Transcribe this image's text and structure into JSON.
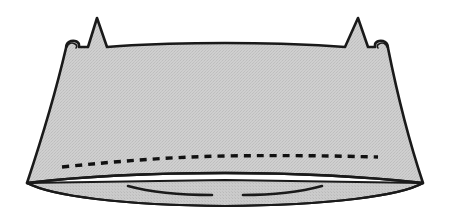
{
  "figure": {
    "title": "Gathered fabric panel with tapered side seams, two pointed tabs and a basting stitch line",
    "type": "line-drawing",
    "caption": "",
    "canvas": {
      "width": 450,
      "height": 213,
      "background": "#ffffff"
    },
    "colors": {
      "outline": "#1a1a1a",
      "fill_light_gray": "#c9c9c9",
      "fill_under_gray": "#c4c4c4",
      "stitch_dash": "#111111",
      "background": "#ffffff"
    },
    "stroke": {
      "outline_width": 2.6,
      "inner_width": 2.0,
      "dash_width": 3.4,
      "dash_pattern": "7 6"
    },
    "parts": [
      {
        "name": "main-panel",
        "label": "Main fabric panel",
        "description": "Large light-gray trapezoid, wider at the top, with slightly curved top and bottom edges and inward-sloping sides"
      },
      {
        "name": "left-tab",
        "label": "Left pointed tab",
        "description": "Triangular spike rising above the top edge near the left",
        "apex": {
          "x": 97,
          "y": 18
        }
      },
      {
        "name": "right-tab",
        "label": "Right pointed tab",
        "description": "Triangular spike rising above the top edge near the right",
        "apex": {
          "x": 358,
          "y": 18
        }
      },
      {
        "name": "left-hook-nub",
        "label": "Left corner hook",
        "description": "Small rounded nub at the upper-left corner"
      },
      {
        "name": "right-hook-nub",
        "label": "Right corner hook",
        "description": "Small rounded nub at the upper-right corner"
      },
      {
        "name": "stitch-line",
        "label": "Dashed basting stitch line",
        "description": "Dashed curve running across the panel just above its lower edge"
      },
      {
        "name": "under-panel",
        "label": "Lower curved under-panel",
        "description": "Shallow lens-shaped piece visible beneath the lower edge of the main panel"
      },
      {
        "name": "left-inner-arc",
        "label": "Left inner fold arc",
        "description": "Short arc sweeping from the lower-left toward the center, ending before midpoint"
      },
      {
        "name": "right-inner-arc",
        "label": "Right inner fold arc",
        "description": "Short arc sweeping from the lower-right toward the center, ending before midpoint"
      }
    ],
    "geometry": {
      "panel_top_left": {
        "x": 66,
        "y": 48
      },
      "panel_top_right": {
        "x": 388,
        "y": 48
      },
      "panel_bottom_left": {
        "x": 27,
        "y": 183
      },
      "panel_bottom_right": {
        "x": 423,
        "y": 183
      },
      "stitch_start": {
        "x": 62,
        "y": 166
      },
      "stitch_end": {
        "x": 378,
        "y": 157
      }
    },
    "annotations": []
  }
}
